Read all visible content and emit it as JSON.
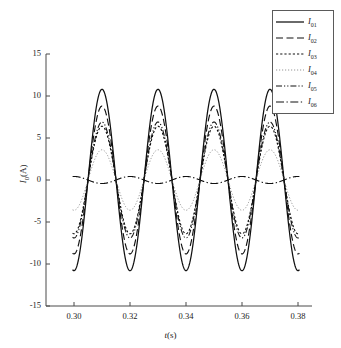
{
  "chart_data": {
    "type": "line",
    "title": "",
    "xlabel": "t(s)",
    "ylabel": "I0(A)",
    "xlim": [
      0.29,
      0.385
    ],
    "ylim": [
      -15,
      15
    ],
    "xticks": [
      0.3,
      0.32,
      0.34,
      0.36,
      0.38
    ],
    "xticklabels": [
      "0.30",
      "0.32",
      "0.34",
      "0.36",
      "0.38"
    ],
    "yticks": [
      15,
      10,
      5,
      0,
      -5,
      -10,
      -15
    ],
    "yticklabels": [
      "15",
      "10",
      "5",
      "0",
      "-5",
      "-10",
      "-15"
    ],
    "grid": false,
    "legend_position": "top-right",
    "frequency_hz": 50,
    "period_s": 0.02,
    "peak_times": [
      0.31,
      0.33,
      0.35,
      0.37
    ],
    "trough_times": [
      0.32,
      0.34,
      0.36,
      0.38
    ],
    "series": [
      {
        "name": "I01",
        "label": "I",
        "sub": "01",
        "amplitude": 10.8,
        "phase_deg": 0,
        "dash": "none",
        "width": 1.25,
        "color": "#111111"
      },
      {
        "name": "I02",
        "label": "I",
        "sub": "02",
        "amplitude": 8.8,
        "phase_deg": 0,
        "dash": "dashed",
        "width": 1.15,
        "color": "#111111"
      },
      {
        "name": "I03",
        "label": "I",
        "sub": "03",
        "amplitude": 6.4,
        "phase_deg": 0,
        "dash": "dotted",
        "width": 1.15,
        "color": "#111111"
      },
      {
        "name": "I04",
        "label": "I",
        "sub": "04",
        "amplitude": 3.6,
        "phase_deg": 0,
        "dash": "fine-dotted",
        "width": 0.9,
        "color": "#8a8a8a"
      },
      {
        "name": "I05",
        "label": "I",
        "sub": "05",
        "amplitude": 6.9,
        "phase_deg": 0,
        "dash": "dash-dot-dot",
        "width": 1.1,
        "color": "#111111"
      },
      {
        "name": "I06",
        "label": "I",
        "sub": "06",
        "amplitude": 0.42,
        "phase_deg": 180,
        "dash": "dash-dot",
        "width": 1.15,
        "color": "#111111"
      }
    ]
  },
  "axes": {
    "x_label_var": "t",
    "x_label_unit": "(s)",
    "y_label_var": "I",
    "y_label_sub": "0",
    "y_label_unit": "(A)"
  },
  "legend": {
    "entries": [
      {
        "label": "I",
        "sub": "01"
      },
      {
        "label": "I",
        "sub": "02"
      },
      {
        "label": "I",
        "sub": "03"
      },
      {
        "label": "I",
        "sub": "04"
      },
      {
        "label": "I",
        "sub": "05"
      },
      {
        "label": "I",
        "sub": "06"
      }
    ]
  }
}
